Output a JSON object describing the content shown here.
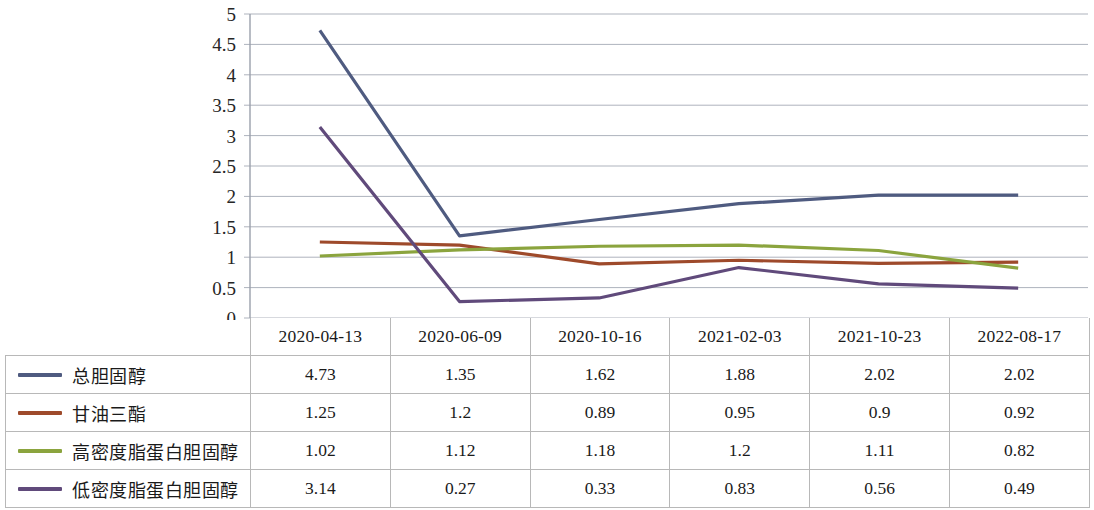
{
  "chart_data": {
    "type": "line",
    "title": "",
    "xlabel": "",
    "ylabel": "",
    "ylim": [
      0,
      5
    ],
    "ytick_step": 0.5,
    "grid": true,
    "legend_position": "table-left",
    "yticks": [
      "5",
      "4.5",
      "4",
      "3.5",
      "3",
      "2.5",
      "2",
      "1.5",
      "1",
      "0.5",
      "0"
    ],
    "categories": [
      "2020-04-13",
      "2020-06-09",
      "2020-10-16",
      "2021-02-03",
      "2021-10-23",
      "2022-08-17"
    ],
    "series": [
      {
        "name": "总胆固醇",
        "color": "#4F5B80",
        "values": [
          4.73,
          1.35,
          1.62,
          1.88,
          2.02,
          2.02
        ],
        "values_text": [
          "4.73",
          "1.35",
          "1.62",
          "1.88",
          "2.02",
          "2.02"
        ]
      },
      {
        "name": "甘油三酯",
        "color": "#9E4A2B",
        "values": [
          1.25,
          1.2,
          0.89,
          0.95,
          0.9,
          0.92
        ],
        "values_text": [
          "1.25",
          "1.2",
          "0.89",
          "0.95",
          "0.9",
          "0.92"
        ]
      },
      {
        "name": "高密度脂蛋白胆固醇",
        "color": "#8BA43E",
        "values": [
          1.02,
          1.12,
          1.18,
          1.2,
          1.11,
          0.82
        ],
        "values_text": [
          "1.02",
          "1.12",
          "1.18",
          "1.2",
          "1.11",
          "0.82"
        ]
      },
      {
        "name": "低密度脂蛋白胆固醇",
        "color": "#604A7B",
        "values": [
          3.14,
          0.27,
          0.33,
          0.83,
          0.56,
          0.49
        ],
        "values_text": [
          "3.14",
          "0.27",
          "0.33",
          "0.83",
          "0.56",
          "0.49"
        ]
      }
    ]
  },
  "table": {
    "corner_label": "",
    "column_headers": [
      "2020-04-13",
      "2020-06-09",
      "2020-10-16",
      "2021-02-03",
      "2021-10-23",
      "2022-08-17"
    ],
    "rows": [
      {
        "label": "总胆固醇",
        "color": "#4F5B80",
        "cells": [
          "4.73",
          "1.35",
          "1.62",
          "1.88",
          "2.02",
          "2.02"
        ]
      },
      {
        "label": "甘油三酯",
        "color": "#9E4A2B",
        "cells": [
          "1.25",
          "1.2",
          "0.89",
          "0.95",
          "0.9",
          "0.92"
        ]
      },
      {
        "label": "高密度脂蛋白胆固醇",
        "color": "#8BA43E",
        "cells": [
          "1.02",
          "1.12",
          "1.18",
          "1.2",
          "1.11",
          "0.82"
        ]
      },
      {
        "label": "低密度脂蛋白胆固醇",
        "color": "#604A7B",
        "cells": [
          "3.14",
          "0.27",
          "0.33",
          "0.83",
          "0.56",
          "0.49"
        ]
      }
    ]
  },
  "axis": {
    "gridline_color": "#aeb3bd",
    "axisline_color": "#9aa0ab"
  }
}
